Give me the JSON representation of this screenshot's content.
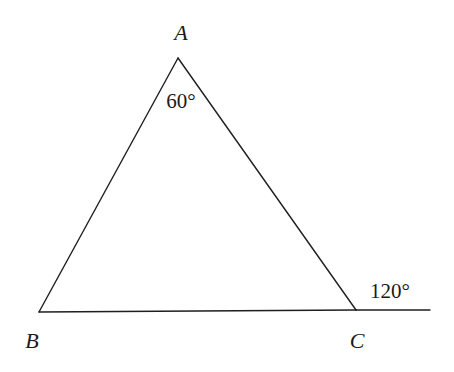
{
  "diagram": {
    "type": "triangle-with-exterior-angle",
    "vertices": [
      {
        "name": "A",
        "x": 178,
        "y": 58,
        "label_x": 181,
        "label_y": 40
      },
      {
        "name": "B",
        "x": 39,
        "y": 312,
        "label_x": 32,
        "label_y": 348
      },
      {
        "name": "C",
        "x": 356,
        "y": 310,
        "label_x": 357,
        "label_y": 348
      }
    ],
    "extension": {
      "from": "C",
      "to_x": 430,
      "to_y": 310
    },
    "angles": [
      {
        "at": "A",
        "text": "60°",
        "kind": "interior",
        "label_x": 181,
        "label_y": 108
      },
      {
        "at": "C",
        "text": "120°",
        "kind": "exterior",
        "label_x": 390,
        "label_y": 298
      }
    ],
    "line_color": "#1f1f1f"
  }
}
